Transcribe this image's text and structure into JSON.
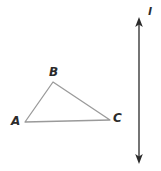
{
  "figure": {
    "background_color": "#ffffff",
    "width": 161,
    "height": 171,
    "triangle": {
      "name": "triangle-ABC",
      "stroke_color": "#9a9a9a",
      "stroke_width": 1.3,
      "fill": "none",
      "vertices": [
        {
          "label": "A",
          "x": 25,
          "y": 122
        },
        {
          "label": "B",
          "x": 53,
          "y": 82
        },
        {
          "label": "C",
          "x": 110,
          "y": 120
        }
      ],
      "edges": [
        {
          "from": "A",
          "to": "B"
        },
        {
          "from": "B",
          "to": "C"
        },
        {
          "from": "C",
          "to": "A"
        }
      ]
    },
    "line": {
      "label": "l",
      "name": "line-l",
      "stroke_color": "#3a3a3a",
      "stroke_width": 1.4,
      "orientation": "vertical",
      "x": 139,
      "y_top": 18,
      "y_bottom": 163,
      "arrowheads": "both",
      "arrowhead_color": "#2b2b2b"
    },
    "labels": {
      "A": "A",
      "B": "B",
      "C": "C",
      "l": "l"
    }
  }
}
